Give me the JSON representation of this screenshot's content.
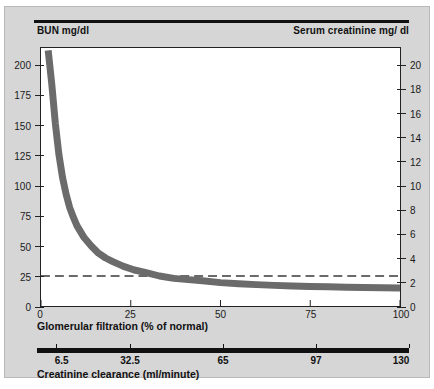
{
  "figure": {
    "left_axis_title": "BUN mg/dl",
    "right_axis_title": "Serum creatinine mg/ dl",
    "x_axis_caption": "Glomerular filtration (% of normal)",
    "secondary_axis_caption": "Creatinine clearance (ml/minute)",
    "background_color": "#d6d6d6",
    "plot_background": "#ffffff",
    "curve_color": "#6b6b6b",
    "axis_color": "#222222",
    "reference_line_color": "#3a3a3a"
  },
  "chart_data": {
    "type": "line",
    "title": "",
    "xlabel": "Glomerular filtration (% of normal)",
    "ylabel": "BUN mg/dl",
    "y2label": "Serum creatinine mg/ dl",
    "grid": false,
    "legend": "none",
    "xlim": [
      0,
      100
    ],
    "ylim": [
      0,
      215
    ],
    "y2lim": [
      0,
      21.5
    ],
    "xticks": [
      0,
      25,
      50,
      75,
      100
    ],
    "xticklabels": [
      "0",
      "25",
      "50",
      "75",
      "100"
    ],
    "yticks": [
      0,
      25,
      50,
      75,
      100,
      125,
      150,
      175,
      200
    ],
    "yticklabels": [
      "0",
      "25",
      "50",
      "75",
      "100",
      "125",
      "150",
      "175",
      "200"
    ],
    "y2ticks": [
      0,
      2,
      4,
      6,
      8,
      10,
      12,
      14,
      16,
      18,
      20
    ],
    "y2ticklabels": [
      "0",
      "2",
      "4",
      "6",
      "8",
      "10",
      "12",
      "14",
      "16",
      "18",
      "20"
    ],
    "secondary_x_axis": {
      "label": "Creatinine clearance (ml/minute)",
      "ticks": [
        6.5,
        32.5,
        65,
        97,
        130
      ],
      "ticklabels": [
        "6.5",
        "32.5",
        "65",
        "97",
        "130"
      ],
      "positions_pct": [
        5,
        25,
        50,
        75,
        100
      ]
    },
    "annotations": [
      {
        "type": "reference-line",
        "style": "dashed",
        "orientation": "horizontal",
        "y_left": 25,
        "y_right": 2,
        "label": ""
      }
    ],
    "series": [
      {
        "name": "BUN / serum creatinine vs GFR",
        "x": [
          2,
          3,
          4,
          5,
          6,
          7,
          8,
          9,
          10,
          12,
          14,
          16,
          18,
          20,
          23,
          26,
          29,
          33,
          37,
          41,
          45,
          50,
          55,
          60,
          65,
          70,
          75,
          80,
          85,
          90,
          95,
          100
        ],
        "y_bun": [
          213,
          185,
          152,
          126,
          107,
          93,
          82,
          74,
          67,
          57,
          50,
          44,
          40,
          37,
          33,
          30,
          28,
          25,
          23,
          22,
          21,
          19.5,
          18.5,
          17.8,
          17.2,
          16.7,
          16.3,
          16,
          15.7,
          15.4,
          15.2,
          15
        ],
        "y_creatinine": [
          21.3,
          18.5,
          15.2,
          12.6,
          10.7,
          9.3,
          8.2,
          7.4,
          6.7,
          5.7,
          5.0,
          4.4,
          4.0,
          3.7,
          3.3,
          3.0,
          2.8,
          2.5,
          2.3,
          2.2,
          2.1,
          1.95,
          1.85,
          1.78,
          1.72,
          1.67,
          1.63,
          1.6,
          1.57,
          1.54,
          1.52,
          1.5
        ]
      }
    ]
  }
}
